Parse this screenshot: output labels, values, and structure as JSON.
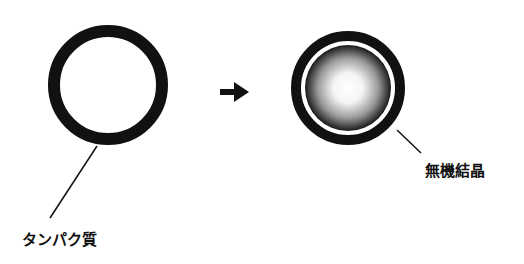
{
  "diagram": {
    "labels": {
      "protein": "タンパク質",
      "inorganic_crystal": "無機結晶"
    },
    "stages": [
      {
        "name": "before",
        "description": "protein shell ring"
      },
      {
        "name": "after",
        "description": "protein shell with inorganic crystal core"
      }
    ],
    "arrow": "right-arrow",
    "colors": {
      "ring": "#111111",
      "background": "#ffffff",
      "core_center": "#ffffff",
      "core_edge": "#1a1a1a"
    }
  }
}
